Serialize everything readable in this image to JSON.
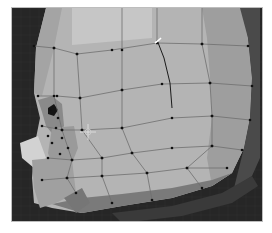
{
  "app": {
    "view": "3D viewport",
    "mode": "edit-mode mesh",
    "object": "low-poly head (side view)"
  },
  "colors": {
    "background": "#262626",
    "grid": "#333333",
    "face_light": "#bdbdbd",
    "face_mid": "#a9a9a9",
    "face_dark": "#8e8e8e",
    "face_shadow": "#5a5a5a",
    "edge": "#6b6b6b",
    "vertex": "#111111",
    "selection": "#ffffff"
  },
  "icons": {
    "cursor": "3d-cursor-crosshair-icon"
  }
}
